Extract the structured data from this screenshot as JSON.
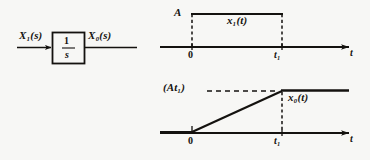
{
  "figure": {
    "background_color": "#f7f7f5",
    "ink_color": "#14120f",
    "block_diagram": {
      "input_label": "X₁(s)",
      "output_label": "X₀(s)",
      "transfer_function_numerator": "1",
      "transfer_function_denominator": "s",
      "transfer_function": "1/s"
    },
    "charts": [
      {
        "id": "input-waveform",
        "type": "line",
        "title": "",
        "signal_label": "x₁(t)",
        "xlabel": "t",
        "ylabel": "",
        "x_tick_labels": [
          "0",
          "t₁"
        ],
        "y_tick_labels": [
          "A"
        ],
        "amplitude_label": "A",
        "grid": false,
        "description": "rectangular pulse of height A from t=0 to t=t1",
        "x": [
          0,
          0,
          1,
          1
        ],
        "y": [
          0,
          1,
          1,
          0
        ],
        "xlim": [
          -0.2,
          1.75
        ],
        "ylim": [
          0,
          1.15
        ]
      },
      {
        "id": "output-waveform",
        "type": "line",
        "title": "",
        "signal_label": "x₀(t)",
        "xlabel": "t",
        "ylabel": "",
        "x_tick_labels": [
          "0",
          "t₁"
        ],
        "y_tick_labels": [
          "(At₁)"
        ],
        "amplitude_label": "(At₁)",
        "grid": false,
        "description": "ramp from 0 rising linearly to At1 at t=t1, then constant at At1",
        "x": [
          0,
          1,
          1.75
        ],
        "y": [
          0,
          1,
          1
        ],
        "xlim": [
          -0.2,
          1.75
        ],
        "ylim": [
          0,
          1.15
        ]
      }
    ]
  }
}
